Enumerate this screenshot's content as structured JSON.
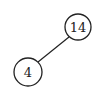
{
  "diagram": {
    "type": "binary-tree",
    "nodes": [
      {
        "id": "n14",
        "label": "14",
        "cx": 78,
        "cy": 27,
        "r": 13
      },
      {
        "id": "n4",
        "label": "4",
        "cx": 28,
        "cy": 72,
        "r": 14
      }
    ],
    "edges": [
      {
        "from": "n14",
        "to": "n4",
        "relation": "left-child"
      }
    ],
    "colors": {
      "stroke": "#222222",
      "fill": "#ffffff"
    }
  }
}
